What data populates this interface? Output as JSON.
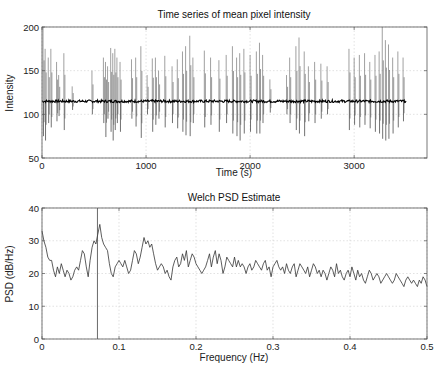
{
  "figure": {
    "width": 446,
    "height": 377
  },
  "chart_data": [
    {
      "type": "line",
      "title": "Time series of mean pixel intensity",
      "xlabel": "Time (s)",
      "ylabel": "Intensity",
      "xlim": [
        0,
        3700
      ],
      "ylim": [
        50,
        200
      ],
      "xticks": [
        0,
        1000,
        2000,
        3000
      ],
      "yticks": [
        50,
        100,
        150,
        200
      ],
      "grid": true,
      "series": [
        {
          "name": "mean pixel intensity",
          "color": "#000000",
          "baseline": 115,
          "x_end": 3500,
          "bursts": [
            {
              "x": 10,
              "hi": 200,
              "lo": 75
            },
            {
              "x": 30,
              "hi": 175,
              "lo": 70
            },
            {
              "x": 60,
              "hi": 165,
              "lo": 90
            },
            {
              "x": 85,
              "hi": 175,
              "lo": 85
            },
            {
              "x": 140,
              "hi": 160,
              "lo": 92
            },
            {
              "x": 160,
              "hi": 145,
              "lo": 98
            },
            {
              "x": 210,
              "hi": 170,
              "lo": 82
            },
            {
              "x": 290,
              "hi": 132,
              "lo": 105
            },
            {
              "x": 480,
              "hi": 150,
              "lo": 100
            },
            {
              "x": 590,
              "hi": 165,
              "lo": 90
            },
            {
              "x": 610,
              "hi": 160,
              "lo": 74
            },
            {
              "x": 630,
              "hi": 155,
              "lo": 95
            },
            {
              "x": 660,
              "hi": 176,
              "lo": 80
            },
            {
              "x": 680,
              "hi": 170,
              "lo": 70
            },
            {
              "x": 700,
              "hi": 175,
              "lo": 82
            },
            {
              "x": 720,
              "hi": 165,
              "lo": 90
            },
            {
              "x": 750,
              "hi": 160,
              "lo": 80
            },
            {
              "x": 860,
              "hi": 163,
              "lo": 95
            },
            {
              "x": 900,
              "hi": 165,
              "lo": 86
            },
            {
              "x": 950,
              "hi": 178,
              "lo": 73
            },
            {
              "x": 1010,
              "hi": 145,
              "lo": 100
            },
            {
              "x": 1060,
              "hi": 164,
              "lo": 80
            },
            {
              "x": 1090,
              "hi": 165,
              "lo": 88
            },
            {
              "x": 1120,
              "hi": 150,
              "lo": 95
            },
            {
              "x": 1180,
              "hi": 167,
              "lo": 85
            },
            {
              "x": 1250,
              "hi": 155,
              "lo": 90
            },
            {
              "x": 1300,
              "hi": 163,
              "lo": 84
            },
            {
              "x": 1350,
              "hi": 172,
              "lo": 80
            },
            {
              "x": 1380,
              "hi": 178,
              "lo": 76
            },
            {
              "x": 1420,
              "hi": 190,
              "lo": 75
            },
            {
              "x": 1450,
              "hi": 165,
              "lo": 90
            },
            {
              "x": 1560,
              "hi": 173,
              "lo": 85
            },
            {
              "x": 1620,
              "hi": 165,
              "lo": 88
            },
            {
              "x": 1700,
              "hi": 162,
              "lo": 80
            },
            {
              "x": 1770,
              "hi": 168,
              "lo": 90
            },
            {
              "x": 1830,
              "hi": 178,
              "lo": 78
            },
            {
              "x": 1870,
              "hi": 165,
              "lo": 75
            },
            {
              "x": 1900,
              "hi": 170,
              "lo": 70
            },
            {
              "x": 1940,
              "hi": 175,
              "lo": 78
            },
            {
              "x": 2000,
              "hi": 168,
              "lo": 80
            },
            {
              "x": 2060,
              "hi": 172,
              "lo": 78
            },
            {
              "x": 2090,
              "hi": 182,
              "lo": 78
            },
            {
              "x": 2120,
              "hi": 168,
              "lo": 90
            },
            {
              "x": 2190,
              "hi": 140,
              "lo": 102
            },
            {
              "x": 2350,
              "hi": 145,
              "lo": 100
            },
            {
              "x": 2380,
              "hi": 165,
              "lo": 90
            },
            {
              "x": 2440,
              "hi": 178,
              "lo": 82
            },
            {
              "x": 2470,
              "hi": 188,
              "lo": 78
            },
            {
              "x": 2520,
              "hi": 172,
              "lo": 75
            },
            {
              "x": 2560,
              "hi": 155,
              "lo": 92
            },
            {
              "x": 2620,
              "hi": 160,
              "lo": 90
            },
            {
              "x": 2680,
              "hi": 158,
              "lo": 95
            },
            {
              "x": 2740,
              "hi": 155,
              "lo": 100
            },
            {
              "x": 2950,
              "hi": 175,
              "lo": 82
            },
            {
              "x": 3000,
              "hi": 165,
              "lo": 88
            },
            {
              "x": 3050,
              "hi": 168,
              "lo": 85
            },
            {
              "x": 3100,
              "hi": 170,
              "lo": 88
            },
            {
              "x": 3150,
              "hi": 160,
              "lo": 84
            },
            {
              "x": 3200,
              "hi": 168,
              "lo": 80
            },
            {
              "x": 3240,
              "hi": 172,
              "lo": 78
            },
            {
              "x": 3270,
              "hi": 200,
              "lo": 72
            },
            {
              "x": 3300,
              "hi": 185,
              "lo": 70
            },
            {
              "x": 3330,
              "hi": 180,
              "lo": 72
            },
            {
              "x": 3370,
              "hi": 165,
              "lo": 78
            },
            {
              "x": 3420,
              "hi": 172,
              "lo": 85
            },
            {
              "x": 3470,
              "hi": 165,
              "lo": 92
            }
          ]
        }
      ]
    },
    {
      "type": "line",
      "title": "Welch PSD Estimate",
      "xlabel": "Frequency (Hz)",
      "ylabel": "PSD (dB/Hz)",
      "xlim": [
        0,
        0.5
      ],
      "ylim": [
        0,
        40
      ],
      "xticks": [
        0,
        0.1,
        0.2,
        0.3,
        0.4,
        0.5
      ],
      "yticks": [
        0,
        10,
        20,
        30,
        40
      ],
      "grid": true,
      "marker_line_x": 0.072,
      "series": [
        {
          "name": "PSD",
          "color": "#333333",
          "x_step": 0.0025,
          "values": [
            33,
            30,
            28,
            25,
            24,
            24,
            21,
            19,
            22,
            20,
            23,
            21,
            19,
            21,
            20,
            18,
            19,
            21,
            22,
            21,
            24,
            27,
            26,
            22,
            19,
            24,
            28,
            30,
            29,
            32,
            35,
            31,
            29,
            28,
            27,
            23,
            20,
            19,
            22,
            23,
            24,
            23,
            22,
            24,
            22,
            20,
            21,
            24,
            27,
            26,
            23,
            25,
            28,
            31,
            29,
            30,
            28,
            29,
            26,
            23,
            21,
            22,
            23,
            22,
            20,
            21,
            19,
            18,
            22,
            24,
            25,
            22,
            23,
            26,
            24,
            27,
            22,
            24,
            26,
            25,
            23,
            22,
            21,
            20,
            21,
            22,
            24,
            26,
            22,
            25,
            27,
            23,
            26,
            24,
            20,
            22,
            25,
            24,
            23,
            22,
            25,
            22,
            24,
            22,
            23,
            22,
            20,
            22,
            23,
            21,
            22,
            24,
            23,
            22,
            21,
            23,
            24,
            21,
            22,
            19,
            22,
            23,
            24,
            22,
            21,
            22,
            20,
            23,
            21,
            20,
            22,
            23,
            19,
            21,
            23,
            22,
            21,
            20,
            22,
            19,
            21,
            23,
            22,
            20,
            21,
            19,
            21,
            20,
            18,
            20,
            22,
            21,
            19,
            23,
            20,
            21,
            19,
            18,
            20,
            21,
            19,
            22,
            20,
            18,
            21,
            19,
            20,
            18,
            17,
            19,
            21,
            20,
            18,
            19,
            20,
            19,
            17,
            18,
            19,
            20,
            19,
            18,
            17,
            18,
            20,
            19,
            18,
            17,
            16,
            18,
            19,
            18,
            17,
            18,
            17,
            16,
            18,
            17,
            19,
            18,
            16
          ]
        }
      ]
    }
  ]
}
